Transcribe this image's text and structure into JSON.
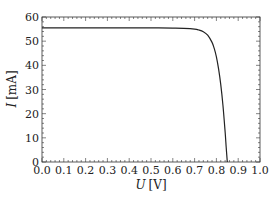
{
  "chart_data": {
    "type": "line",
    "title": "",
    "xlabel": "U [V]",
    "xlabel_var": "U",
    "xlabel_unit": "[V]",
    "ylabel": "I [mA]",
    "ylabel_var": "I",
    "ylabel_unit": "[mA]",
    "xlim": [
      0.0,
      1.0
    ],
    "ylim": [
      0,
      60
    ],
    "xticks": [
      "0.0",
      "0.1",
      "0.2",
      "0.3",
      "0.4",
      "0.5",
      "0.6",
      "0.7",
      "0.8",
      "0.9",
      "1.0"
    ],
    "yticks": [
      "0",
      "10",
      "20",
      "30",
      "40",
      "50",
      "60"
    ],
    "grid": false,
    "legend": null,
    "series": [
      {
        "name": "I-U curve",
        "color": "#222222",
        "x": [
          0.0,
          0.1,
          0.2,
          0.3,
          0.4,
          0.5,
          0.6,
          0.65,
          0.7,
          0.72,
          0.74,
          0.76,
          0.78,
          0.79,
          0.8,
          0.81,
          0.82,
          0.83,
          0.84,
          0.845,
          0.85
        ],
        "y": [
          55.5,
          55.5,
          55.5,
          55.5,
          55.5,
          55.5,
          55.4,
          55.3,
          55.0,
          54.6,
          53.9,
          52.5,
          49.5,
          47.0,
          43.5,
          38.5,
          32.0,
          23.5,
          12.5,
          6.0,
          0.0
        ]
      }
    ]
  }
}
